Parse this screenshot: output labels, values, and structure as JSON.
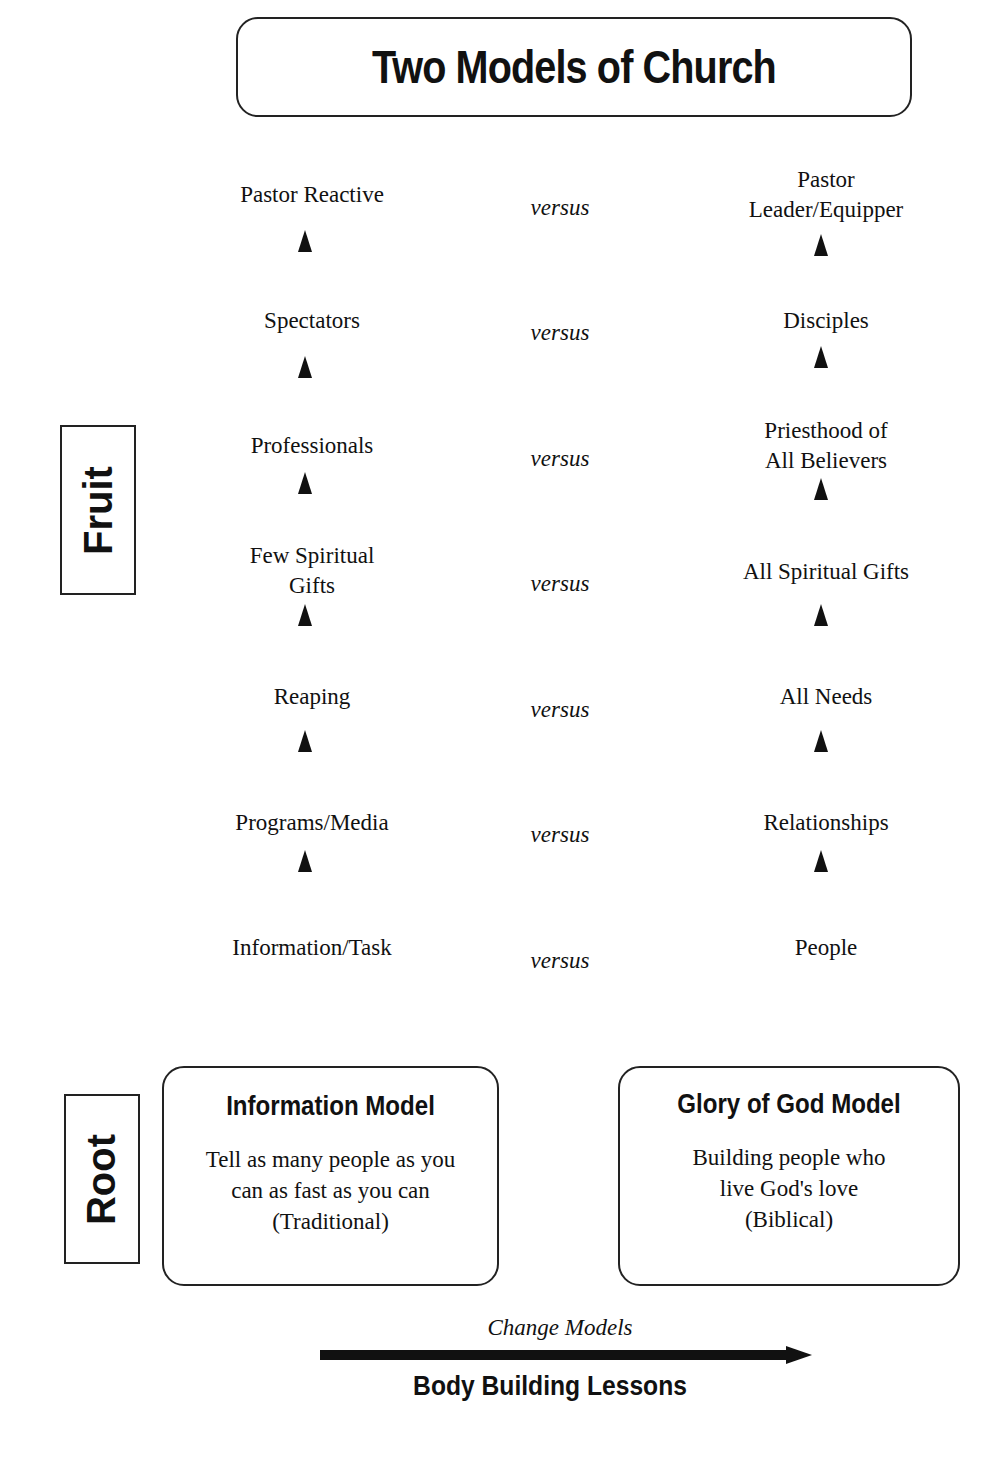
{
  "title": "Two Models of Church",
  "connector": "versus",
  "side_labels": {
    "fruit": "Fruit",
    "root": "Root"
  },
  "rows": [
    {
      "left": "Pastor Reactive",
      "right": "Pastor Leader/Equipper"
    },
    {
      "left": "Spectators",
      "right": "Disciples"
    },
    {
      "left": "Professionals",
      "right": "Priesthood of All Believers"
    },
    {
      "left": "Few Spiritual Gifts",
      "right": "All Spiritual Gifts"
    },
    {
      "left": "Reaping",
      "right": "All Needs"
    },
    {
      "left": "Programs/Media",
      "right": "Relationships"
    },
    {
      "left": "Information/Task",
      "right": "People"
    }
  ],
  "models": {
    "left": {
      "title": "Information Model",
      "desc_lines": [
        "Tell as many people as you",
        "can as fast as you can",
        "(Traditional)"
      ]
    },
    "right": {
      "title": "Glory of God Model",
      "desc_lines": [
        "Building people who",
        "live God's love",
        "(Biblical)"
      ]
    }
  },
  "footer": {
    "arrow_label": "Change Models",
    "caption": "Body Building Lessons"
  }
}
